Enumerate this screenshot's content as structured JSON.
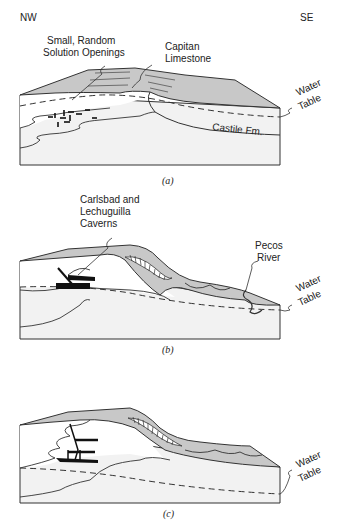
{
  "compass": {
    "left": "NW",
    "right": "SE"
  },
  "panels": [
    {
      "caption": "(a)",
      "labels": {
        "openings_line1": "Small, Random",
        "openings_line2": "Solution Openings",
        "capitan_line1": "Capitan",
        "capitan_line2": "Limestone",
        "water_line1": "Water",
        "water_line2": "Table",
        "castile": "Castile Fm."
      }
    },
    {
      "caption": "(b)",
      "labels": {
        "caverns_line1": "Carlsbad and",
        "caverns_line2": "Lechuguilla",
        "caverns_line3": "Caverns",
        "pecos_line1": "Pecos",
        "pecos_line2": "River",
        "water_line1": "Water",
        "water_line2": "Table"
      }
    },
    {
      "caption": "(c)",
      "labels": {
        "water_line1": "Water",
        "water_line2": "Table"
      }
    }
  ],
  "colors": {
    "limestone": "#c8c8c8",
    "lower_block": "#f2f2f2",
    "outline": "#333333"
  }
}
